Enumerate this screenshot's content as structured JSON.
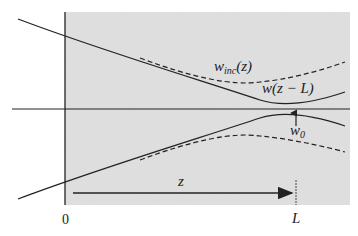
{
  "diagram": {
    "labels": {
      "w_inc": {
        "base": "w",
        "sub": "inc",
        "arg": "(z)"
      },
      "w_focus": "w(z − L)",
      "w0": {
        "base": "w",
        "sub": "0"
      },
      "z": "z",
      "origin": "0",
      "L": "L"
    },
    "colors": {
      "medium": "#d9d9d9",
      "line": "#222222",
      "background": "#ffffff"
    }
  }
}
